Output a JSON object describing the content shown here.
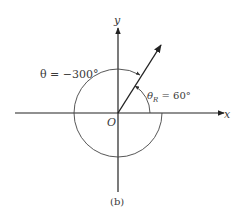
{
  "figure": {
    "caption": "(b)",
    "axes": {
      "x_label": "x",
      "y_label": "y",
      "origin_label": "O"
    },
    "angles": {
      "theta_label": "θ = −300°",
      "theta_value_deg": -300,
      "reference_label_symbol": "θ",
      "reference_label_subscript": "R",
      "reference_label_value": " = 60°",
      "reference_value_deg": 60
    },
    "colors": {
      "line": "#222222",
      "arc": "#444444",
      "text": "#3a3a3a",
      "background": "#ffffff"
    }
  }
}
